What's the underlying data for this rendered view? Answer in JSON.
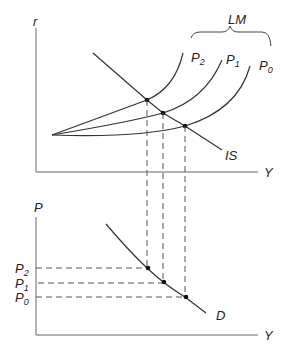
{
  "top_panel": {
    "y_axis_label": "r",
    "x_axis_label": "Y",
    "lm_group_label": "LM",
    "lm_curves": [
      {
        "label": "P",
        "sub": "2"
      },
      {
        "label": "P",
        "sub": "1"
      },
      {
        "label": "P",
        "sub": "0"
      }
    ],
    "is_label": "IS"
  },
  "bottom_panel": {
    "y_axis_label": "P",
    "x_axis_label": "Y",
    "price_levels": [
      {
        "label": "P",
        "sub": "2"
      },
      {
        "label": "P",
        "sub": "1"
      },
      {
        "label": "P",
        "sub": "0"
      }
    ],
    "demand_label": "D"
  },
  "colors": {
    "line": "#333333",
    "dashed": "#555555",
    "text": "#222222"
  }
}
